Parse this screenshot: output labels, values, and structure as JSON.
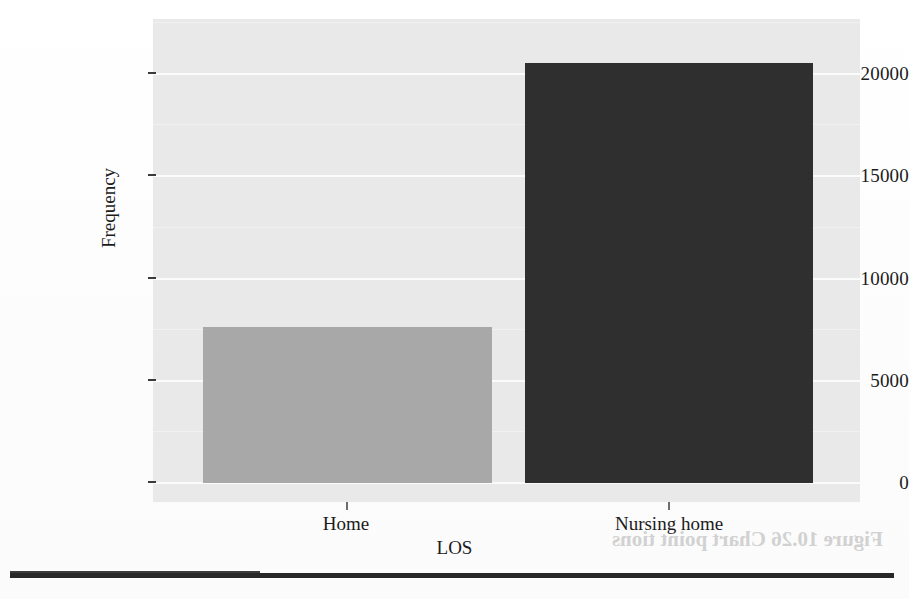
{
  "chart_data": {
    "type": "bar",
    "title": "",
    "xlabel": "LOS",
    "ylabel": "Frequency",
    "categories": [
      "Home",
      "Nursing home"
    ],
    "values": [
      8000,
      21600
    ],
    "series": [
      {
        "name": "Frequency",
        "values": [
          8000,
          21600
        ]
      }
    ],
    "ylim": [
      0,
      23700
    ],
    "yticks": [
      0,
      5000,
      10000,
      15000,
      20000
    ],
    "ytick_labels": [
      "0",
      "5000",
      "10000",
      "15000",
      "20000"
    ],
    "xtick_labels": [
      "Home",
      "Nursing home"
    ],
    "grid": true,
    "legend": "none",
    "bar_colors": [
      "#a8a8a8",
      "#2f2f2f"
    ],
    "panel_background": "#e9e9e9",
    "gridline_color": "#fbfbfb"
  },
  "axes": {
    "y_title": "Frequency",
    "x_title": "LOS",
    "y_labels": [
      "20000",
      "15000",
      "10000",
      "5000",
      "0"
    ],
    "x_labels": [
      "Home",
      "Nursing home"
    ]
  },
  "bars": [
    {
      "label": "Home",
      "value": 8000,
      "color": "#a8a8a8"
    },
    {
      "label": "Nursing home",
      "value": 21600,
      "color": "#2f2f2f"
    }
  ],
  "scan_artifacts": {
    "caption_ghost": "Figure 10.26   Chart point tions",
    "ghost_number_1": "5000",
    "ghost_number_2": "15000",
    "ghost_number_3": "20000",
    "ghost_line_1": "reversed page show-through"
  },
  "colors": {
    "bar_light": "#a8a8a8",
    "bar_dark": "#2f2f2f",
    "panel": "#e9e9e9",
    "grid": "#fbfbfb",
    "text": "#1b1b1b",
    "rule": "#272727"
  }
}
